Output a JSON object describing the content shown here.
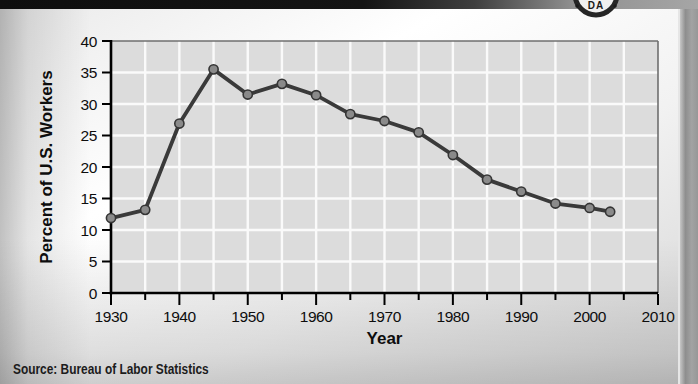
{
  "source_note": "Source: Bureau of Labor Statistics",
  "badge": {
    "visible_text": "DA"
  },
  "chart_data": {
    "type": "line",
    "x": [
      1930,
      1935,
      1940,
      1945,
      1950,
      1955,
      1960,
      1965,
      1970,
      1975,
      1980,
      1985,
      1990,
      1995,
      2000,
      2003
    ],
    "values": [
      11.9,
      13.2,
      26.9,
      35.5,
      31.5,
      33.2,
      31.4,
      28.4,
      27.3,
      25.5,
      21.9,
      18.0,
      16.1,
      14.2,
      13.5,
      12.9
    ],
    "title": "",
    "xlabel": "Year",
    "ylabel": "Percent of U.S. Workers",
    "xlim": [
      1930,
      2010
    ],
    "ylim": [
      0,
      40
    ],
    "x_minor_tick_step": 5,
    "x_label_step": 10,
    "y_tick_step": 5,
    "grid": true,
    "legend_position": "none",
    "colors": {
      "line": "#3a3a3a",
      "marker_fill": "#8a8a8a",
      "marker_stroke": "#353535",
      "plot_bg": "#dcdcdc",
      "grid": "#fafafa",
      "axis": "#000000",
      "plot_border": "#6f6f6f"
    }
  }
}
